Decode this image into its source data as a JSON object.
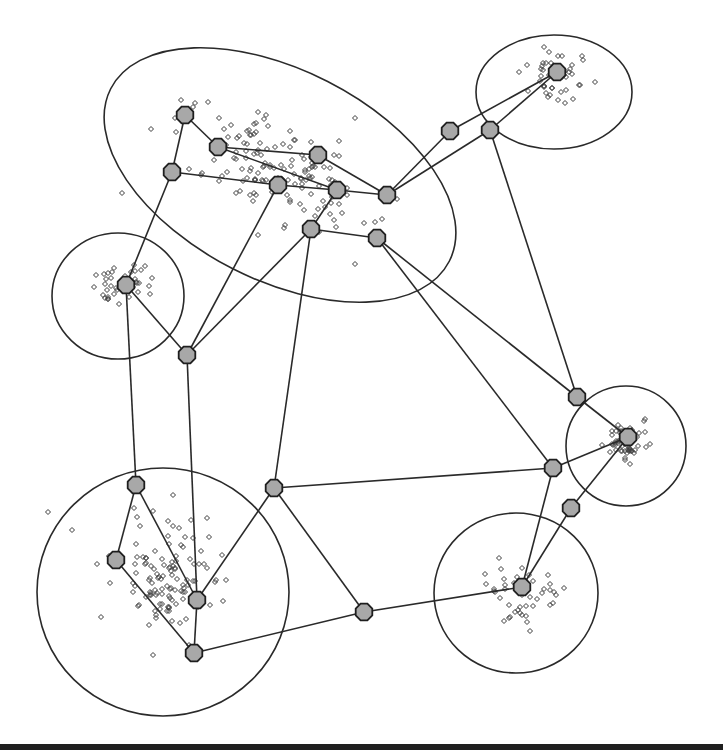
{
  "diagram": {
    "type": "clustered-network-graph",
    "colors": {
      "background": "#ffffff",
      "stroke": "#2a2a2a",
      "node_fill": "#a8a8a8",
      "node_stroke": "#1e1e1e",
      "point_stroke": "#3a3a3a",
      "bottom_rule": "#1f1f1f"
    },
    "clusters": [
      {
        "id": "C1",
        "shape": "ellipse",
        "cx": 280,
        "cy": 175,
        "rx": 190,
        "ry": 105,
        "rotate": 27
      },
      {
        "id": "C2",
        "shape": "ellipse",
        "cx": 554,
        "cy": 92,
        "rx": 78,
        "ry": 57,
        "rotate": 0
      },
      {
        "id": "C3",
        "shape": "ellipse",
        "cx": 118,
        "cy": 296,
        "rx": 66,
        "ry": 63,
        "rotate": 0
      },
      {
        "id": "C4",
        "shape": "ellipse",
        "cx": 626,
        "cy": 446,
        "rx": 60,
        "ry": 60,
        "rotate": 0
      },
      {
        "id": "C5",
        "shape": "ellipse",
        "cx": 163,
        "cy": 592,
        "rx": 126,
        "ry": 124,
        "rotate": 0
      },
      {
        "id": "C6",
        "shape": "ellipse",
        "cx": 516,
        "cy": 593,
        "rx": 82,
        "ry": 80,
        "rotate": 0
      }
    ],
    "nodes": [
      {
        "id": "N1",
        "x": 185,
        "y": 115
      },
      {
        "id": "N2",
        "x": 218,
        "y": 147
      },
      {
        "id": "N3",
        "x": 172,
        "y": 172
      },
      {
        "id": "N4",
        "x": 278,
        "y": 185
      },
      {
        "id": "N5",
        "x": 318,
        "y": 155
      },
      {
        "id": "N6",
        "x": 337,
        "y": 190
      },
      {
        "id": "N7",
        "x": 387,
        "y": 195
      },
      {
        "id": "N8",
        "x": 311,
        "y": 229
      },
      {
        "id": "N9",
        "x": 377,
        "y": 238
      },
      {
        "id": "N10",
        "x": 450,
        "y": 131
      },
      {
        "id": "N11",
        "x": 490,
        "y": 130
      },
      {
        "id": "N12",
        "x": 557,
        "y": 72
      },
      {
        "id": "N13",
        "x": 126,
        "y": 285
      },
      {
        "id": "N14",
        "x": 187,
        "y": 355
      },
      {
        "id": "N15",
        "x": 577,
        "y": 397
      },
      {
        "id": "N16",
        "x": 628,
        "y": 437
      },
      {
        "id": "N17",
        "x": 553,
        "y": 468
      },
      {
        "id": "N18",
        "x": 571,
        "y": 508
      },
      {
        "id": "N19",
        "x": 136,
        "y": 485
      },
      {
        "id": "N20",
        "x": 116,
        "y": 560
      },
      {
        "id": "N21",
        "x": 197,
        "y": 600
      },
      {
        "id": "N22",
        "x": 194,
        "y": 653
      },
      {
        "id": "N23",
        "x": 274,
        "y": 488
      },
      {
        "id": "N24",
        "x": 364,
        "y": 612
      },
      {
        "id": "N25",
        "x": 522,
        "y": 587
      }
    ],
    "edges": [
      [
        "N1",
        "N3"
      ],
      [
        "N1",
        "N2"
      ],
      [
        "N2",
        "N5"
      ],
      [
        "N2",
        "N6"
      ],
      [
        "N3",
        "N4"
      ],
      [
        "N4",
        "N6"
      ],
      [
        "N5",
        "N7"
      ],
      [
        "N6",
        "N7"
      ],
      [
        "N6",
        "N8"
      ],
      [
        "N8",
        "N9"
      ],
      [
        "N7",
        "N10"
      ],
      [
        "N7",
        "N11"
      ],
      [
        "N10",
        "N12"
      ],
      [
        "N11",
        "N12"
      ],
      [
        "N11",
        "N15"
      ],
      [
        "N3",
        "N13"
      ],
      [
        "N4",
        "N14"
      ],
      [
        "N8",
        "N14"
      ],
      [
        "N8",
        "N23"
      ],
      [
        "N9",
        "N17"
      ],
      [
        "N9",
        "N15"
      ],
      [
        "N13",
        "N14"
      ],
      [
        "N13",
        "N19"
      ],
      [
        "N14",
        "N21"
      ],
      [
        "N19",
        "N20"
      ],
      [
        "N19",
        "N21"
      ],
      [
        "N20",
        "N22"
      ],
      [
        "N21",
        "N22"
      ],
      [
        "N21",
        "N23"
      ],
      [
        "N22",
        "N24"
      ],
      [
        "N23",
        "N17"
      ],
      [
        "N23",
        "N24"
      ],
      [
        "N24",
        "N25"
      ],
      [
        "N17",
        "N16"
      ],
      [
        "N17",
        "N25"
      ],
      [
        "N18",
        "N16"
      ],
      [
        "N18",
        "N25"
      ],
      [
        "N15",
        "N16"
      ]
    ],
    "point_clouds": [
      {
        "cluster": "C1",
        "center": [
          280,
          170
        ],
        "spread": [
          95,
          50
        ],
        "count": 150,
        "seed": 11
      },
      {
        "cluster": "C2",
        "center": [
          560,
          75
        ],
        "spread": [
          30,
          22
        ],
        "count": 45,
        "seed": 23
      },
      {
        "cluster": "C3",
        "center": [
          122,
          282
        ],
        "spread": [
          26,
          18
        ],
        "count": 40,
        "seed": 37
      },
      {
        "cluster": "C4",
        "center": [
          630,
          442
        ],
        "spread": [
          24,
          18
        ],
        "count": 55,
        "seed": 41
      },
      {
        "cluster": "C5",
        "center": [
          170,
          580
        ],
        "spread": [
          55,
          60
        ],
        "count": 120,
        "seed": 53
      },
      {
        "cluster": "C6",
        "center": [
          520,
          590
        ],
        "spread": [
          40,
          32
        ],
        "count": 45,
        "seed": 67
      }
    ],
    "outlier_points": [
      [
        48,
        512
      ],
      [
        122,
        193
      ],
      [
        355,
        118
      ],
      [
        72,
        530
      ]
    ]
  }
}
